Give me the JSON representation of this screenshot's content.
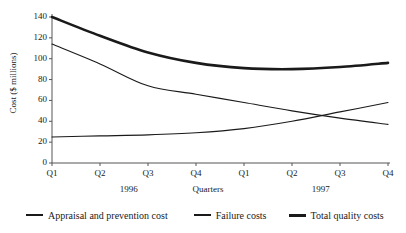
{
  "chart_data": {
    "type": "line",
    "title": "",
    "xlabel": "Quarters",
    "ylabel": "Cost ($ millions)",
    "categories": [
      "Q1",
      "Q2",
      "Q3",
      "Q4",
      "Q1",
      "Q2",
      "Q3",
      "Q4"
    ],
    "group_labels": [
      "1996",
      "1997"
    ],
    "ylim": [
      0,
      140
    ],
    "yticks": [
      0,
      20,
      40,
      60,
      80,
      100,
      120,
      140
    ],
    "grid": false,
    "legend_position": "bottom",
    "series": [
      {
        "name": "Appraisal and prevention cost",
        "values": [
          25,
          26,
          27,
          29,
          33,
          40,
          49,
          58
        ],
        "line_width": "thin",
        "color": "#1a1a1a"
      },
      {
        "name": "Failure costs",
        "values": [
          114,
          95,
          74,
          66,
          58,
          50,
          43,
          37
        ],
        "line_width": "thin",
        "color": "#1a1a1a"
      },
      {
        "name": "Total quality costs",
        "values": [
          140,
          122,
          106,
          96,
          91,
          90,
          92,
          96
        ],
        "line_width": "thick",
        "color": "#1a1a1a"
      }
    ]
  },
  "axis": {
    "y_title": "Cost ($ millions)",
    "x_title": "Quarters",
    "y_tick_labels": [
      "0",
      "20",
      "40",
      "60",
      "80",
      "100",
      "120",
      "140"
    ],
    "x_tick_labels": [
      "Q1",
      "Q2",
      "Q3",
      "Q4",
      "Q1",
      "Q2",
      "Q3",
      "Q4"
    ],
    "group_labels": [
      "1996",
      "1997"
    ]
  },
  "legend": {
    "items": [
      {
        "label": "Appraisal and prevention cost",
        "style": "thin"
      },
      {
        "label": "Failure costs",
        "style": "thin"
      },
      {
        "label": "Total quality costs",
        "style": "thick"
      }
    ]
  },
  "colors": {
    "ink": "#1a1a1a",
    "axis": "#555555",
    "background": "#ffffff"
  }
}
